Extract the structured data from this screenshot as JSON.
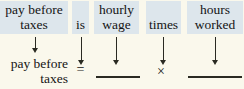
{
  "figure": {
    "type": "word-equation-diagram",
    "background_color": "#faf8ec",
    "highlight_color": "#dde6ec",
    "ink_color": "#141414"
  },
  "top_row": {
    "boxes": [
      {
        "name": "pay-before-taxes",
        "line1": "pay before",
        "line2": "taxes"
      },
      {
        "name": "is",
        "line1": "is",
        "line2": ""
      },
      {
        "name": "hourly-wage",
        "line1": "hourly",
        "line2": "wage"
      },
      {
        "name": "times",
        "line1": "times",
        "line2": ""
      },
      {
        "name": "hours-worked",
        "line1": "hours",
        "line2": "worked"
      }
    ]
  },
  "arrows": {
    "count": 5,
    "glyph": "downward-arrow"
  },
  "bottom_row": {
    "label_line1": "pay before",
    "label_line2": "taxes",
    "equals": "=",
    "blank_1": "",
    "multiply": "×",
    "blank_2": ""
  }
}
